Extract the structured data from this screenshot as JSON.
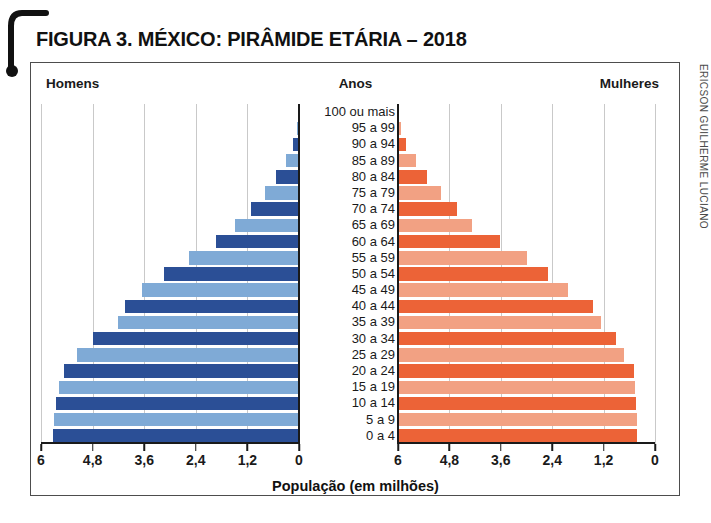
{
  "figure": {
    "title": "FIGURA 3. MÉXICO: PIRÂMIDE ETÁRIA – 2018",
    "credit": "ERICSON GUILHERME LUCIANO",
    "caption_men": "Homens",
    "caption_years": "Anos",
    "caption_women": "Mulheres",
    "axis_title": "População (em milhões)"
  },
  "colors": {
    "male_dark": "#2B4F96",
    "male_light": "#7FAAD6",
    "female_dark": "#EC6337",
    "female_light": "#F2A183",
    "gridline": "#c9c9c9",
    "axis": "#1a1a1a",
    "frame": "#4d4d4d"
  },
  "chart_data": {
    "type": "bar",
    "subtype": "population-pyramid",
    "title": "FIGURA 3. MÉXICO: PIRÂMIDE ETÁRIA – 2018",
    "xlabel": "População (em milhões)",
    "ylabel": "Anos",
    "xlim": [
      0,
      6
    ],
    "grid": true,
    "legend": "none",
    "tick_labels": [
      "6",
      "4,8",
      "3,6",
      "2,4",
      "1,2",
      "0"
    ],
    "tick_values": [
      6,
      4.8,
      3.6,
      2.4,
      1.2,
      0
    ],
    "tick_labels_right": [
      "0",
      "1,2",
      "2,4",
      "3,6",
      "4,8",
      "6"
    ],
    "categories": [
      "100 ou mais",
      "95 a 99",
      "90 a 94",
      "85 a 89",
      "80 a 84",
      "75 a 79",
      "70 a 74",
      "65 a 69",
      "60 a 64",
      "55 a 59",
      "50 a 54",
      "45 a 49",
      "40 a 44",
      "35 a 39",
      "30 a 34",
      "25 a 29",
      "20 a 24",
      "15 a 19",
      "10 a 14",
      "5 a 9",
      "0 a 4"
    ],
    "series": [
      {
        "name": "Homens",
        "side": "left",
        "values": [
          0.02,
          0.05,
          0.13,
          0.31,
          0.53,
          0.8,
          1.12,
          1.5,
          1.94,
          2.55,
          3.14,
          3.66,
          4.05,
          4.2,
          4.79,
          5.17,
          5.46,
          5.58,
          5.66,
          5.69,
          5.72
        ]
      },
      {
        "name": "Mulheres",
        "side": "right",
        "values": [
          0.03,
          0.08,
          0.19,
          0.41,
          0.68,
          1.0,
          1.37,
          1.72,
          2.39,
          3.0,
          3.5,
          3.98,
          4.55,
          4.73,
          5.1,
          5.27,
          5.5,
          5.54,
          5.56,
          5.58,
          5.59
        ]
      }
    ]
  }
}
